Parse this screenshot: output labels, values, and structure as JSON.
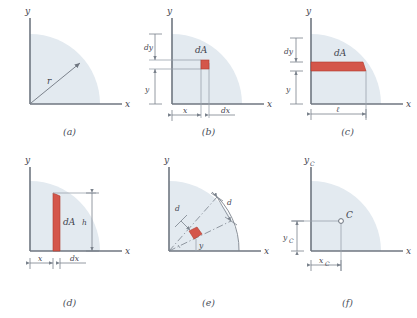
{
  "figure": {
    "title_visible": false,
    "background_color": "#ffffff",
    "shade_color": "#e3eaf0",
    "shade_color_2": "#dde6ee",
    "element_color": "#d4564a",
    "element_stroke": "#b03a2e",
    "axis_color": "#6f7680",
    "dim_color": "#7a828c",
    "text_color": "#3f434d"
  },
  "panels": [
    {
      "id": "a",
      "caption": "(a)",
      "axis_x_label": "x",
      "axis_y_label": "y",
      "labels": [
        {
          "name": "radius",
          "text": "r"
        }
      ]
    },
    {
      "id": "b",
      "caption": "(b)",
      "axis_x_label": "x",
      "axis_y_label": "y",
      "labels": [
        {
          "name": "area-element",
          "text": "dA"
        },
        {
          "name": "dim-dy",
          "text": "dy"
        },
        {
          "name": "dim-y",
          "text": "y"
        },
        {
          "name": "dim-x",
          "text": "x"
        },
        {
          "name": "dim-dx",
          "text": "dx"
        }
      ]
    },
    {
      "id": "c",
      "caption": "(c)",
      "axis_x_label": "x",
      "axis_y_label": "y",
      "labels": [
        {
          "name": "area-element",
          "text": "dA"
        },
        {
          "name": "dim-dy",
          "text": "dy"
        },
        {
          "name": "dim-y",
          "text": "y"
        },
        {
          "name": "dim-length",
          "text": "ℓ"
        }
      ]
    },
    {
      "id": "d",
      "caption": "(d)",
      "axis_x_label": "x",
      "axis_y_label": "y",
      "labels": [
        {
          "name": "area-element",
          "text": "dA"
        },
        {
          "name": "dim-height",
          "text": "h"
        },
        {
          "name": "dim-x",
          "text": "x"
        },
        {
          "name": "dim-dx",
          "text": "dx"
        }
      ]
    },
    {
      "id": "e",
      "caption": "(e)",
      "axis_x_label": "x",
      "axis_y_label": "y",
      "labels": [
        {
          "name": "dim-d-radial",
          "text": "d"
        },
        {
          "name": "dim-d-arc",
          "text": "d"
        },
        {
          "name": "dim-y",
          "text": "y"
        }
      ]
    },
    {
      "id": "f",
      "caption": "(f)",
      "axis_x_label": "x",
      "axis_y_label_main": "y",
      "axis_y_label_sub": "C",
      "labels": [
        {
          "name": "centroid-marker",
          "text": "C"
        },
        {
          "name": "dim-yc-main",
          "text": "y"
        },
        {
          "name": "dim-yc-sub",
          "text": "C"
        },
        {
          "name": "dim-xc-main",
          "text": "x"
        },
        {
          "name": "dim-xc-sub",
          "text": "C"
        }
      ]
    }
  ]
}
